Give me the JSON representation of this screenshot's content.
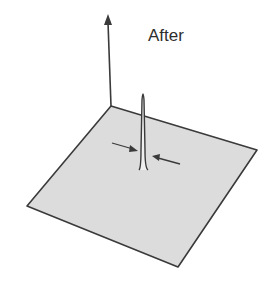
{
  "figure": {
    "title": "After",
    "colors": {
      "plane_fill": "#dcdcdc",
      "stroke": "#3a3a3a",
      "background": "#ffffff"
    },
    "elements": {
      "vertical_axis": "arrow",
      "plane": "square-in-perspective",
      "spike": "narrow-peak",
      "width_arrows": [
        "left-arrow-pointing-right",
        "right-arrow-pointing-left"
      ]
    }
  }
}
